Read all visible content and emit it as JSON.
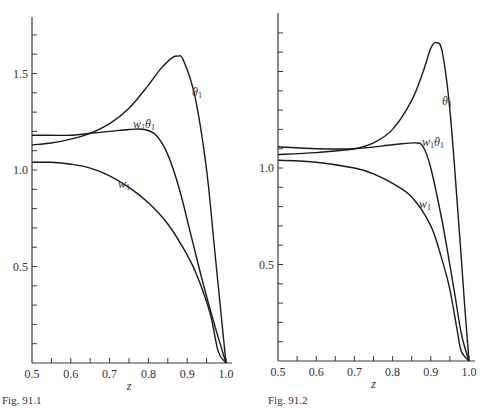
{
  "figures": [
    {
      "caption": "Fig. 91.1",
      "xlabel": "z"
    },
    {
      "caption": "Fig. 91.2",
      "xlabel": "z"
    }
  ],
  "chart_data": [
    {
      "type": "line",
      "title": "Fig. 91.1",
      "xlabel": "z",
      "ylabel": "",
      "xlim": [
        0.5,
        1.0
      ],
      "ylim": [
        0,
        1.8
      ],
      "x_ticks": [
        "0.5",
        "0.6",
        "0.7",
        "0.8",
        "0.9",
        "1.0"
      ],
      "y_ticks": [
        "0.5",
        "1.0",
        "1.5"
      ],
      "grid": false,
      "legend": "inline labels",
      "series": [
        {
          "name": "θ1",
          "label": "θ",
          "sub": "1",
          "x": [
            0.5,
            0.55,
            0.6,
            0.65,
            0.7,
            0.75,
            0.8,
            0.83,
            0.86,
            0.875,
            0.89,
            0.92,
            0.95,
            0.97,
            0.99,
            1.0
          ],
          "y": [
            1.13,
            1.14,
            1.16,
            1.19,
            1.24,
            1.32,
            1.44,
            1.52,
            1.58,
            1.59,
            1.57,
            1.38,
            1.0,
            0.6,
            0.2,
            0.0
          ]
        },
        {
          "name": "w1θ1",
          "label": "w",
          "label2": "θ",
          "sub": "1",
          "x": [
            0.5,
            0.55,
            0.6,
            0.65,
            0.7,
            0.75,
            0.79,
            0.82,
            0.85,
            0.88,
            0.91,
            0.94,
            0.97,
            1.0
          ],
          "y": [
            1.18,
            1.18,
            1.18,
            1.19,
            1.2,
            1.21,
            1.21,
            1.18,
            1.08,
            0.9,
            0.66,
            0.42,
            0.2,
            0.0
          ]
        },
        {
          "name": "w1",
          "label": "w",
          "sub": "1",
          "x": [
            0.5,
            0.55,
            0.6,
            0.65,
            0.7,
            0.75,
            0.8,
            0.85,
            0.9,
            0.93,
            0.96,
            0.98,
            1.0
          ],
          "y": [
            1.04,
            1.04,
            1.03,
            1.01,
            0.97,
            0.91,
            0.83,
            0.72,
            0.56,
            0.43,
            0.25,
            0.06,
            0.0
          ]
        }
      ]
    },
    {
      "type": "line",
      "title": "Fig. 91.2",
      "xlabel": "z",
      "ylabel": "",
      "xlim": [
        0.5,
        1.0
      ],
      "ylim": [
        0,
        1.8
      ],
      "x_ticks": [
        "0.5",
        "0.6",
        "0.7",
        "0.8",
        "0.9",
        "1.0"
      ],
      "y_ticks": [
        "0.5",
        "1.0"
      ],
      "grid": false,
      "legend": "inline labels",
      "series": [
        {
          "name": "θ1",
          "label": "θ",
          "sub": "1",
          "x": [
            0.5,
            0.6,
            0.7,
            0.75,
            0.8,
            0.85,
            0.88,
            0.9,
            0.915,
            0.93,
            0.95,
            0.97,
            0.99,
            1.0
          ],
          "y": [
            1.07,
            1.08,
            1.1,
            1.13,
            1.2,
            1.35,
            1.5,
            1.62,
            1.65,
            1.6,
            1.3,
            0.8,
            0.25,
            0.0
          ]
        },
        {
          "name": "w1θ1",
          "label": "w",
          "label2": "θ",
          "sub": "1",
          "x": [
            0.5,
            0.6,
            0.7,
            0.8,
            0.86,
            0.88,
            0.9,
            0.93,
            0.96,
            0.98,
            1.0
          ],
          "y": [
            1.11,
            1.1,
            1.1,
            1.12,
            1.13,
            1.11,
            1.0,
            0.72,
            0.38,
            0.14,
            0.0
          ]
        },
        {
          "name": "w1",
          "label": "w",
          "sub": "1",
          "x": [
            0.5,
            0.6,
            0.7,
            0.75,
            0.8,
            0.85,
            0.9,
            0.93,
            0.95,
            0.97,
            0.98,
            1.0
          ],
          "y": [
            1.04,
            1.03,
            1.0,
            0.97,
            0.92,
            0.85,
            0.7,
            0.52,
            0.37,
            0.15,
            0.05,
            0.0
          ]
        }
      ]
    }
  ]
}
